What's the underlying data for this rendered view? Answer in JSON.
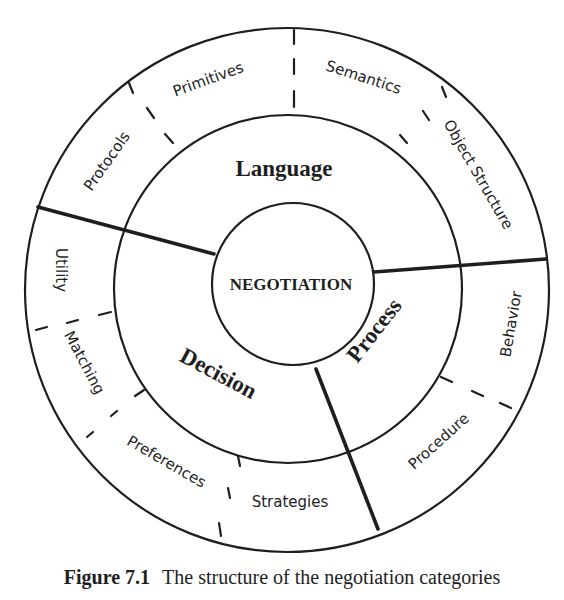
{
  "diagram": {
    "core": "NEGOTIATION",
    "categories": {
      "language": "Language",
      "decision": "Decision",
      "process": "Process"
    },
    "subcategories": {
      "language": [
        "Protocols",
        "Primitives",
        "Semantics",
        "Object Structure"
      ],
      "decision": [
        "Utility",
        "Matching",
        "Preferences",
        "Strategies"
      ],
      "process": [
        "Behavior",
        "Procedure"
      ]
    },
    "colors": {
      "ink": "#1e1e1e",
      "background": "#ffffff"
    }
  },
  "caption": {
    "figure_label": "Figure 7.1",
    "text": "The structure of the negotiation categories"
  }
}
